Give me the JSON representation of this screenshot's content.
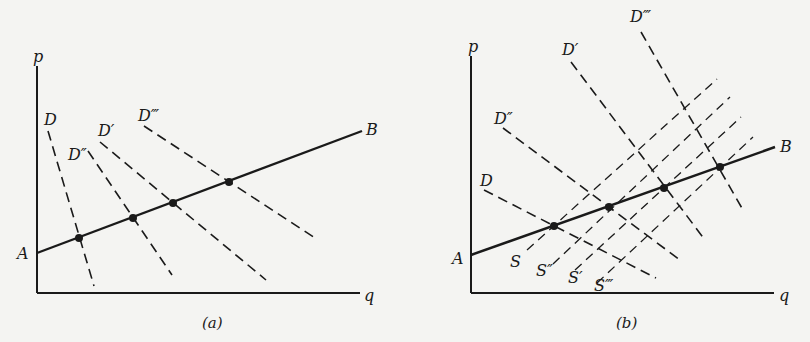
{
  "panels": [
    {
      "id": "a",
      "caption": "(a)",
      "axes": {
        "y_label": "p",
        "x_label": "q",
        "origin": [
          37,
          293
        ],
        "y_top": 66,
        "x_end": 360
      },
      "path_line": {
        "start_label": "A",
        "end_label": "B",
        "from": [
          37,
          253
        ],
        "to": [
          362,
          131
        ]
      },
      "demand_curves": [
        {
          "label": "D",
          "from": [
            48,
            131
          ],
          "to": [
            94,
            286
          ],
          "label_pos": [
            44,
            125
          ]
        },
        {
          "label": "D″",
          "from": [
            88,
            151
          ],
          "to": [
            172,
            275
          ],
          "label_pos": [
            68,
            157
          ]
        },
        {
          "label": "D′",
          "from": [
            100,
            142
          ],
          "to": [
            266,
            280
          ],
          "label_pos": [
            98,
            135
          ]
        },
        {
          "label": "D‴",
          "from": [
            144,
            126
          ],
          "to": [
            315,
            238
          ],
          "label_pos": [
            138,
            121
          ]
        }
      ],
      "supply_curves": [],
      "equilibrium_points": [
        [
          79,
          238
        ],
        [
          133,
          218
        ],
        [
          173,
          203
        ],
        [
          229,
          182
        ]
      ]
    },
    {
      "id": "b",
      "caption": "(b)",
      "axes": {
        "y_label": "p",
        "x_label": "q",
        "origin": [
          471,
          293
        ],
        "y_top": 56,
        "x_end": 774
      },
      "path_line": {
        "start_label": "A",
        "end_label": "B",
        "from": [
          471,
          255
        ],
        "to": [
          775,
          147
        ]
      },
      "demand_curves": [
        {
          "label": "D",
          "from": [
            484,
            190
          ],
          "to": [
            656,
            278
          ],
          "label_pos": [
            480,
            186
          ]
        },
        {
          "label": "D″",
          "from": [
            503,
            128
          ],
          "to": [
            680,
            260
          ],
          "label_pos": [
            494,
            124
          ]
        },
        {
          "label": "D′",
          "from": [
            571,
            62
          ],
          "to": [
            705,
            240
          ],
          "label_pos": [
            562,
            55
          ]
        },
        {
          "label": "D‴",
          "from": [
            641,
            32
          ],
          "to": [
            743,
            210
          ],
          "label_pos": [
            630,
            22
          ]
        }
      ],
      "supply_curves": [
        {
          "label": "S",
          "from": [
            527,
            250
          ],
          "to": [
            717,
            79
          ],
          "label_pos": [
            512,
            266
          ]
        },
        {
          "label": "S″",
          "from": [
            553,
            264
          ],
          "to": [
            730,
            97
          ],
          "label_pos": [
            536,
            274
          ]
        },
        {
          "label": "S′",
          "from": [
            575,
            270
          ],
          "to": [
            741,
            117
          ],
          "label_pos": [
            568,
            282
          ]
        },
        {
          "label": "S‴",
          "from": [
            597,
            283
          ],
          "to": [
            753,
            137
          ],
          "label_pos": [
            594,
            290
          ]
        }
      ],
      "equilibrium_points": [
        [
          554,
          226
        ],
        [
          609,
          207
        ],
        [
          664,
          188
        ],
        [
          720,
          167
        ]
      ]
    }
  ],
  "style": {
    "ink": "#1a1a1a",
    "background": "#f4f4f2"
  }
}
